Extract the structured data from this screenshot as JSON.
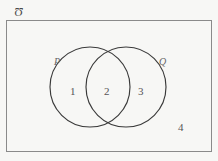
{
  "figure": {
    "kind": "venn-diagram",
    "title": "",
    "background_color": "#f7f7f5",
    "stroke_color": "#3a3a3a",
    "text_color": "#555555"
  },
  "universe": {
    "label": "Ʊ",
    "label_name": "universal-set-symbol",
    "rect": {
      "x": 6,
      "y": 20,
      "width": 206,
      "height": 132
    },
    "border_color": "#8a8a8a"
  },
  "sets": [
    {
      "id": "P",
      "label": "P",
      "cx": 90,
      "cy": 87,
      "r": 40,
      "label_x": 54,
      "label_y": 57
    },
    {
      "id": "Q",
      "label": "Q",
      "cx": 126,
      "cy": 87,
      "r": 40,
      "label_x": 159,
      "label_y": 57
    }
  ],
  "regions": [
    {
      "id": "p-only",
      "label": "1",
      "x": 70,
      "y": 86,
      "description": "P only"
    },
    {
      "id": "p-and-q",
      "label": "2",
      "x": 104,
      "y": 86,
      "description": "P intersect Q"
    },
    {
      "id": "q-only",
      "label": "3",
      "x": 138,
      "y": 86,
      "description": "Q only"
    },
    {
      "id": "outside",
      "label": "4",
      "x": 178,
      "y": 122,
      "description": "outside P and Q"
    }
  ]
}
